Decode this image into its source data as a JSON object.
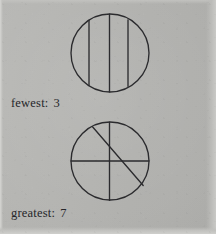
{
  "page": {
    "background_color": "#b2b2af",
    "ink_color": "#2b2b2e",
    "kind": "scanned-worksheet-page"
  },
  "figures": [
    {
      "id": "fewest",
      "name": "circle-divided-fewest",
      "shape": "circle",
      "center": {
        "x": 46,
        "y": 46
      },
      "radius": 39,
      "chord_count": 3,
      "region_count": 3,
      "chords": [
        {
          "type": "vertical-chord",
          "x1": 25,
          "y1": 16,
          "x2": 25,
          "y2": 76
        },
        {
          "type": "vertical-diameter",
          "x1": 45,
          "y1": 7,
          "x2": 45,
          "y2": 85
        },
        {
          "type": "vertical-chord",
          "x1": 64,
          "y1": 14,
          "x2": 64,
          "y2": 78
        }
      ]
    },
    {
      "id": "greatest",
      "name": "circle-divided-greatest",
      "shape": "circle",
      "center": {
        "x": 46,
        "y": 47
      },
      "radius": 39,
      "chord_count": 3,
      "region_count": 7,
      "chords": [
        {
          "type": "vertical-diameter",
          "x1": 45,
          "y1": 8,
          "x2": 45,
          "y2": 86
        },
        {
          "type": "horizontal-diameter",
          "x1": 7,
          "y1": 47,
          "x2": 85,
          "y2": 47
        },
        {
          "type": "diagonal-chord",
          "x1": 29,
          "y1": 13,
          "x2": 79,
          "y2": 71
        }
      ]
    }
  ],
  "captions": [
    {
      "id": "fewest",
      "label": "fewest:",
      "value": "3"
    },
    {
      "id": "greatest",
      "label": "greatest:",
      "value": "7"
    }
  ]
}
